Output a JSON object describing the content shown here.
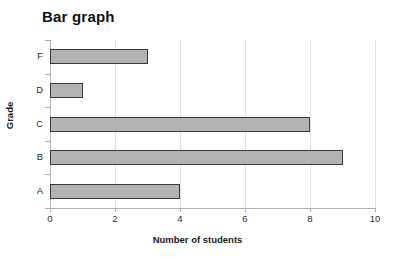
{
  "chart_data": {
    "type": "bar",
    "orientation": "horizontal",
    "title": "Bar graph",
    "xlabel": "Number of students",
    "ylabel": "Grade",
    "categories": [
      "A",
      "B",
      "C",
      "D",
      "F"
    ],
    "values": [
      4,
      9,
      8,
      1,
      3
    ],
    "display_order_top_to_bottom": [
      "F",
      "D",
      "C",
      "B",
      "A"
    ],
    "xlim": [
      0,
      10
    ],
    "xticks": [
      0,
      2,
      4,
      6,
      8,
      10
    ],
    "xtick_labels": [
      "0",
      "2",
      "4",
      "6",
      "8",
      "10"
    ],
    "grid": true,
    "grid_axis": "x",
    "legend": false,
    "bar_fill_color": "#b3b3b3",
    "bar_border_color": "#3a3a3a",
    "gridline_color": "#e2e2e2",
    "axis_color": "#b0b0b0",
    "background_color": "#ffffff",
    "bars": [
      {
        "category": "F",
        "value": 3
      },
      {
        "category": "D",
        "value": 1
      },
      {
        "category": "C",
        "value": 8
      },
      {
        "category": "B",
        "value": 9
      },
      {
        "category": "A",
        "value": 4
      }
    ]
  }
}
